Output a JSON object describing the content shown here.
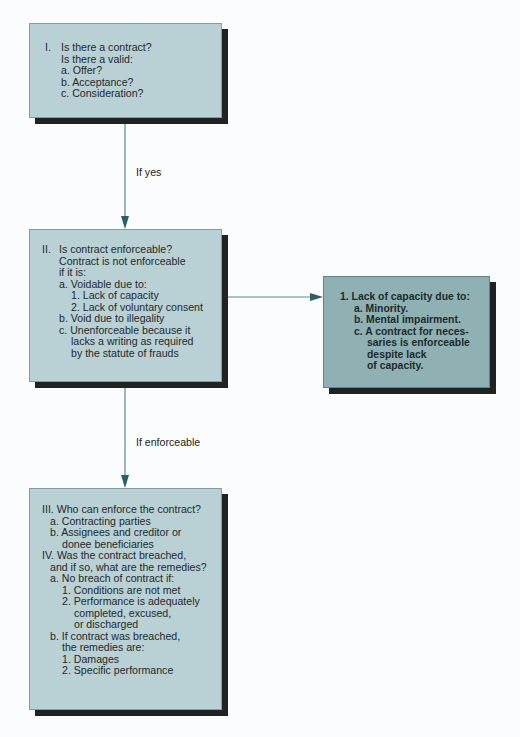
{
  "colors": {
    "box_light": "#b9d0d4",
    "box_dark": "#8fb1b3",
    "shadow": "#222222",
    "connector": "#5a8c90",
    "arrowhead": "#2f5f62",
    "background": "#fbfcfd"
  },
  "box1": {
    "number": "I.",
    "lines": [
      "Is there a contract?",
      "Is there a valid:",
      "a. Offer?",
      "b. Acceptance?",
      "c. Consideration?"
    ]
  },
  "edge1": {
    "label": "If yes"
  },
  "box2": {
    "number": "II.",
    "lines": [
      "Is contract enforceable?",
      "Contract is not enforceable",
      "if it is:",
      "a. Voidable due to:",
      "1. Lack of capacity",
      "2. Lack of voluntary consent",
      "b. Void due to illegality",
      "c. Unenforceable because it",
      "lacks a writing as required",
      "by the statute of frauds"
    ]
  },
  "edge2": {
    "label": "If enforceable"
  },
  "side_box": {
    "lines": [
      "1. Lack of capacity due to:",
      "a. Minority.",
      "b. Mental impairment.",
      "c. A contract for neces-",
      "saries is enforceable",
      "despite lack",
      "of capacity."
    ]
  },
  "box3": {
    "lines": [
      "III. Who can enforce the contract?",
      "a. Contracting parties",
      "b. Assignees and creditor or",
      "donee beneficiaries",
      "IV. Was the contract breached,",
      "and if so, what are the remedies?",
      "a. No breach of contract if:",
      "1. Conditions are not met",
      "2. Performance is adequately",
      "completed, excused,",
      "or discharged",
      "b. If contract was breached,",
      "the remedies are:",
      "1. Damages",
      "2. Specific performance"
    ]
  }
}
